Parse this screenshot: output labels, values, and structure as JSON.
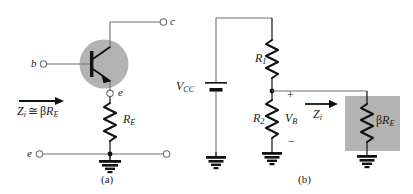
{
  "figure": {
    "colors": {
      "wire": "#6e6e6e",
      "ink": "#1a1a1a",
      "shade": "#b3b3b3",
      "background": "#ffffff"
    }
  },
  "panel_a": {
    "caption": "(a)",
    "terminals": {
      "base": "b",
      "collector": "c",
      "emitter": "e",
      "emitter_bottom": "e"
    },
    "components": {
      "emitter_resistor": {
        "symbol": "R",
        "subscript": "E"
      }
    },
    "annotations": {
      "input_impedance": {
        "symbol": "Z",
        "subscript": "i",
        "relation": "≅",
        "expression_beta": "β",
        "expression_symbol": "R",
        "expression_subscript": "E",
        "full_text": "Zi ≅ βRE"
      }
    }
  },
  "panel_b": {
    "caption": "(b)",
    "components": {
      "supply": {
        "symbol": "V",
        "subscript": "CC"
      },
      "resistor_top": {
        "symbol": "R",
        "subscript": "1"
      },
      "resistor_bottom": {
        "symbol": "R",
        "subscript": "2"
      },
      "reflected_resistance": {
        "beta": "β",
        "symbol": "R",
        "subscript": "E",
        "full_text": "βRE"
      }
    },
    "annotations": {
      "base_voltage": {
        "symbol": "V",
        "subscript": "B"
      },
      "polarity_plus": "+",
      "polarity_minus": "−",
      "input_impedance": {
        "symbol": "Z",
        "subscript": "i"
      }
    }
  }
}
